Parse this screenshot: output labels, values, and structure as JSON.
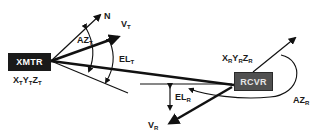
{
  "diagram": {
    "transmitter": {
      "box_label": "XMTR",
      "position_label": {
        "parts": [
          [
            "X",
            "T"
          ],
          [
            "Y",
            "T"
          ],
          [
            "Z",
            "T"
          ]
        ]
      },
      "north_label": "N",
      "velocity_label": {
        "base": "V",
        "sub": "T"
      },
      "azimuth_label": {
        "base": "AZ",
        "sub": "T"
      },
      "elevation_label": {
        "base": "EL",
        "sub": "T"
      }
    },
    "receiver": {
      "box_label": "RCVR",
      "position_label": {
        "parts": [
          [
            "X",
            "R"
          ],
          [
            "Y",
            "R"
          ],
          [
            "Z",
            "R"
          ]
        ]
      },
      "velocity_label": {
        "base": "V",
        "sub": "R"
      },
      "azimuth_label": {
        "base": "AZ",
        "sub": "R"
      },
      "elevation_label": {
        "base": "EL",
        "sub": "R"
      }
    },
    "colors": {
      "xmtr_box": "#1a1a1a",
      "rcvr_box": "#505050",
      "lines": "#111111",
      "background": "#ffffff"
    }
  }
}
